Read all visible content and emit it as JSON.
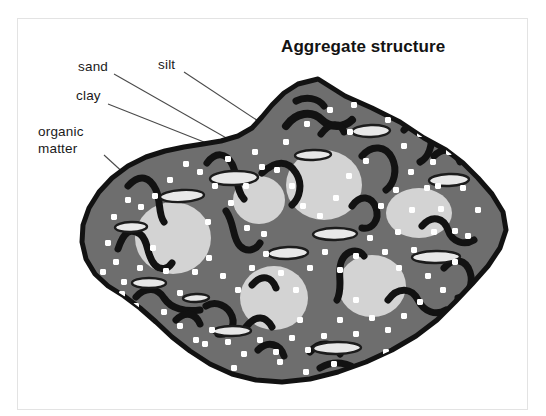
{
  "figure": {
    "title": "Aggregate structure",
    "title_position": {
      "x": 281,
      "y": 52
    },
    "frame": {
      "x": 17,
      "y": 18,
      "width": 511,
      "height": 392,
      "border_color": "#e3e3e3"
    },
    "background_color": "#ffffff"
  },
  "labels": [
    {
      "name": "sand",
      "text": "sand",
      "text_x": 78,
      "text_y": 71,
      "leader": {
        "x1": 114,
        "y1": 74,
        "x2": 258,
        "y2": 156
      }
    },
    {
      "name": "silt",
      "text": "silt",
      "text_x": 158,
      "text_y": 69,
      "leader": {
        "x1": 184,
        "y1": 72,
        "x2": 290,
        "y2": 142
      }
    },
    {
      "name": "clay",
      "text": "clay",
      "text_x": 76,
      "text_y": 100,
      "leader": {
        "x1": 108,
        "y1": 104,
        "x2": 252,
        "y2": 161
      }
    },
    {
      "name": "organic matter",
      "text_lines": [
        "organic",
        "matter"
      ],
      "text_x": 38,
      "text_y": 136,
      "line_height": 17,
      "leader": {
        "x1": 104,
        "y1": 155,
        "x2": 139,
        "y2": 187
      }
    }
  ],
  "legend_semantics": {
    "aggregate_body": "soil aggregate matrix (dark gray)",
    "sand": "large light-gray circles",
    "silt": "outlined light ellipses",
    "clay": "small white dots/squares",
    "organic_matter": "black curved squiggle shapes"
  },
  "colors": {
    "aggregate_fill": "#6e6e6e",
    "aggregate_outline": "#121212",
    "sand_fill": "#d3d3d3",
    "silt_fill": "#e8e8e8",
    "silt_outline": "#1c1c1c",
    "clay_fill": "#ffffff",
    "organic_matter": "#121212",
    "label_color": "#1a1a1a",
    "title_color": "#131313",
    "leader_color": "#4a4a4a"
  },
  "shapes": {
    "aggregate_outline_path": "M 318 79 L 345 96 L 372 108 L 400 122 L 424 138 L 446 150 L 463 163 L 478 178 L 492 194 L 503 212 L 506 230 L 500 248 L 488 266 L 472 284 L 455 302 L 437 320 L 416 336 L 392 350 L 366 362 L 338 372 L 310 379 L 282 382 L 256 380 L 232 374 L 210 364 L 190 351 L 172 337 L 156 322 L 140 308 L 124 296 L 108 286 L 95 274 L 86 259 L 82 242 L 83 225 L 89 208 L 99 192 L 112 178 L 128 166 L 146 157 L 165 151 L 184 147 L 203 144 L 221 141 L 238 136 L 252 128 L 262 117 L 272 105 L 284 93 L 298 84 Z",
    "sand_circles": [
      {
        "cx": 173,
        "cy": 238,
        "rx": 38,
        "ry": 36
      },
      {
        "cx": 259,
        "cy": 200,
        "rx": 26,
        "ry": 24
      },
      {
        "cx": 324,
        "cy": 185,
        "rx": 38,
        "ry": 35
      },
      {
        "cx": 419,
        "cy": 213,
        "rx": 33,
        "ry": 25
      },
      {
        "cx": 274,
        "cy": 298,
        "rx": 34,
        "ry": 32
      },
      {
        "cx": 372,
        "cy": 286,
        "rx": 34,
        "ry": 31
      }
    ],
    "silt_ellipses": [
      {
        "cx": 234,
        "cy": 178,
        "rx": 24,
        "ry": 7,
        "rot": -2
      },
      {
        "cx": 182,
        "cy": 196,
        "rx": 22,
        "ry": 6,
        "rot": -3
      },
      {
        "cx": 131,
        "cy": 227,
        "rx": 16,
        "ry": 5,
        "rot": -2
      },
      {
        "cx": 149,
        "cy": 283,
        "rx": 17,
        "ry": 5,
        "rot": 0
      },
      {
        "cx": 196,
        "cy": 298,
        "rx": 13,
        "ry": 4,
        "rot": -2
      },
      {
        "cx": 232,
        "cy": 331,
        "rx": 19,
        "ry": 5,
        "rot": -1
      },
      {
        "cx": 288,
        "cy": 253,
        "rx": 20,
        "ry": 6,
        "rot": -2
      },
      {
        "cx": 335,
        "cy": 234,
        "rx": 22,
        "ry": 6,
        "rot": -1
      },
      {
        "cx": 371,
        "cy": 131,
        "rx": 19,
        "ry": 6,
        "rot": -2
      },
      {
        "cx": 313,
        "cy": 155,
        "rx": 18,
        "ry": 5,
        "rot": -2
      },
      {
        "cx": 436,
        "cy": 257,
        "rx": 24,
        "ry": 6,
        "rot": -1
      },
      {
        "cx": 449,
        "cy": 180,
        "rx": 20,
        "ry": 6,
        "rot": -2
      },
      {
        "cx": 337,
        "cy": 348,
        "rx": 24,
        "ry": 6,
        "rot": -1
      }
    ],
    "clay_dots": [
      [
        228,
        159
      ],
      [
        255,
        152
      ],
      [
        286,
        142
      ],
      [
        307,
        124
      ],
      [
        330,
        110
      ],
      [
        354,
        105
      ],
      [
        371,
        92
      ],
      [
        388,
        120
      ],
      [
        404,
        146
      ],
      [
        420,
        134
      ],
      [
        433,
        162
      ],
      [
        449,
        152
      ],
      [
        463,
        188
      ],
      [
        478,
        210
      ],
      [
        468,
        236
      ],
      [
        455,
        231
      ],
      [
        441,
        209
      ],
      [
        427,
        188
      ],
      [
        411,
        172
      ],
      [
        396,
        190
      ],
      [
        381,
        206
      ],
      [
        366,
        161
      ],
      [
        349,
        176
      ],
      [
        336,
        198
      ],
      [
        320,
        216
      ],
      [
        303,
        206
      ],
      [
        292,
        186
      ],
      [
        277,
        170
      ],
      [
        262,
        167
      ],
      [
        246,
        186
      ],
      [
        231,
        203
      ],
      [
        215,
        186
      ],
      [
        200,
        172
      ],
      [
        186,
        164
      ],
      [
        170,
        180
      ],
      [
        155,
        196
      ],
      [
        141,
        207
      ],
      [
        128,
        200
      ],
      [
        114,
        217
      ],
      [
        108,
        243
      ],
      [
        116,
        262
      ],
      [
        103,
        272
      ],
      [
        124,
        282
      ],
      [
        140,
        268
      ],
      [
        153,
        248
      ],
      [
        166,
        271
      ],
      [
        180,
        293
      ],
      [
        195,
        272
      ],
      [
        209,
        258
      ],
      [
        223,
        276
      ],
      [
        238,
        290
      ],
      [
        252,
        268
      ],
      [
        266,
        254
      ],
      [
        281,
        273
      ],
      [
        296,
        290
      ],
      [
        310,
        268
      ],
      [
        325,
        252
      ],
      [
        340,
        270
      ],
      [
        356,
        256
      ],
      [
        370,
        238
      ],
      [
        385,
        252
      ],
      [
        399,
        268
      ],
      [
        414,
        250
      ],
      [
        428,
        276
      ],
      [
        443,
        290
      ],
      [
        420,
        302
      ],
      [
        404,
        316
      ],
      [
        388,
        330
      ],
      [
        372,
        318
      ],
      [
        356,
        334
      ],
      [
        340,
        320
      ],
      [
        324,
        336
      ],
      [
        308,
        350
      ],
      [
        292,
        338
      ],
      [
        276,
        352
      ],
      [
        260,
        340
      ],
      [
        244,
        354
      ],
      [
        228,
        342
      ],
      [
        212,
        330
      ],
      [
        196,
        340
      ],
      [
        180,
        326
      ],
      [
        164,
        312
      ],
      [
        150,
        322
      ],
      [
        136,
        306
      ],
      [
        122,
        294
      ],
      [
        247,
        228
      ],
      [
        208,
        222
      ],
      [
        264,
        234
      ],
      [
        300,
        320
      ],
      [
        356,
        300
      ],
      [
        398,
        232
      ],
      [
        434,
        232
      ],
      [
        455,
        262
      ],
      [
        205,
        344
      ],
      [
        280,
        362
      ],
      [
        334,
        364
      ],
      [
        386,
        352
      ],
      [
        306,
        372
      ],
      [
        162,
        338
      ],
      [
        184,
        358
      ],
      [
        234,
        368
      ],
      [
        412,
        210
      ],
      [
        438,
        186
      ],
      [
        396,
        106
      ],
      [
        350,
        132
      ]
    ],
    "organic_matter": [
      {
        "d": "M 118 249 C 124 231, 130 228, 140 234 C 149 240, 146 256, 155 265 C 161 271, 168 269, 172 263",
        "w": 7
      },
      {
        "d": "M 128 186 C 140 173, 150 177, 156 190 C 161 201, 158 214, 164 222",
        "w": 7
      },
      {
        "d": "M 136 297 C 146 286, 158 288, 164 298 C 171 309, 186 312, 200 310",
        "w": 7
      },
      {
        "d": "M 207 163 C 216 151, 226 153, 232 164 C 238 175, 236 191, 244 199",
        "w": 7
      },
      {
        "d": "M 226 211 C 235 224, 232 238, 240 246 C 247 253, 256 250, 260 243",
        "w": 7
      },
      {
        "d": "M 206 306 C 216 300, 228 306, 232 316 C 236 327, 228 336, 218 334",
        "w": 7
      },
      {
        "d": "M 246 327 C 256 314, 266 316, 272 327",
        "w": 7
      },
      {
        "d": "M 252 285 C 262 273, 272 277, 276 288",
        "w": 7
      },
      {
        "d": "M 262 173 C 276 160, 288 160, 296 173 C 303 184, 300 198, 292 205",
        "w": 7
      },
      {
        "d": "M 286 126 C 296 112, 312 110, 322 120 C 330 128, 344 128, 352 120",
        "w": 8
      },
      {
        "d": "M 296 101 C 306 96, 318 98, 324 106",
        "w": 7
      },
      {
        "d": "M 321 134 C 330 122, 340 122, 344 132",
        "w": 7
      },
      {
        "d": "M 310 352 C 320 340, 334 342, 340 354",
        "w": 7
      },
      {
        "d": "M 320 368 C 334 360, 350 362, 358 372",
        "w": 7
      },
      {
        "d": "M 337 300 C 344 286, 336 272, 342 260 C 347 250, 358 248, 364 256",
        "w": 7
      },
      {
        "d": "M 352 206 C 360 194, 372 196, 376 208 C 380 220, 372 230, 362 228",
        "w": 7
      },
      {
        "d": "M 362 156 C 372 144, 386 146, 392 158 C 398 170, 394 184, 386 190",
        "w": 7
      },
      {
        "d": "M 388 300 C 398 286, 412 288, 418 300 C 424 312, 436 316, 446 310",
        "w": 7
      },
      {
        "d": "M 404 130 C 414 118, 426 120, 430 132 C 434 145, 428 158, 420 162",
        "w": 7
      },
      {
        "d": "M 422 226 C 432 214, 444 218, 448 230 C 452 242, 464 246, 474 240",
        "w": 7
      },
      {
        "d": "M 434 156 C 444 146, 456 150, 460 162",
        "w": 7
      },
      {
        "d": "M 444 268 C 454 256, 466 260, 470 272 C 474 284, 468 296, 458 298",
        "w": 7
      },
      {
        "d": "M 176 320 C 186 310, 196 314, 200 324",
        "w": 7
      },
      {
        "d": "M 258 350 C 268 340, 280 344, 284 356",
        "w": 7
      }
    ]
  }
}
